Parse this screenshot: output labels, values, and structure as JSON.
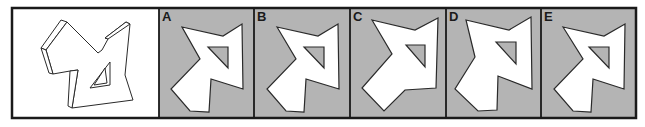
{
  "puzzle": {
    "frame": {
      "x": 12,
      "y": 8,
      "w": 624,
      "h": 110,
      "stroke": "#1a1a1a",
      "stroke_width": 2.5
    },
    "colors": {
      "question_bg": "#ffffff",
      "option_bg": "#b4b4b4",
      "shape_fill": "#ffffff",
      "shape_stroke": "#2a2a2a",
      "label_color": "#1a1a1a"
    },
    "question": {
      "x": 12,
      "y": 8,
      "w": 147,
      "h": 110,
      "faces": [
        "41,48 61,20 67,22 46,50",
        "46,50 67,22 98,53 102,50 108,39 105,38 126,22 130,24 125,75 133,100 72,108 78,70 70,71 53,74",
        "41,48 46,50 53,74 49,73",
        "105,38 108,39 130,24 126,22",
        "70,71 78,70 72,108 68,106",
        "110,62 90,88 110,85",
        "105,68 94,85 107,83"
      ]
    },
    "options": [
      {
        "label": "A",
        "x": 159,
        "w": 95,
        "outline": "182,27 223,36 242,24 243,89 211,79 209,112 190,111 171,89 200,59",
        "hole": "208,47 228,47 228,68"
      },
      {
        "label": "B",
        "x": 254,
        "w": 96,
        "outline": "277,27 318,36 338,24 339,89 306,79 304,112 286,111 267,89 296,59",
        "hole": "304,47 324,47 324,68"
      },
      {
        "label": "C",
        "x": 350,
        "w": 96,
        "outline": "372,20 415,30 438,18 436,88 405,90 384,111 362,88 392,54",
        "hole": "406,45 425,45 425,67"
      },
      {
        "label": "D",
        "x": 446,
        "w": 95,
        "outline": "466,20 509,30 531,17 532,89 498,76 497,110 478,111 455,89 475,57",
        "hole": "496,42 516,42 516,64"
      },
      {
        "label": "E",
        "x": 541,
        "w": 95,
        "outline": "563,27 604,36 625,24 624,89 593,79 591,112 573,111 554,89 583,59",
        "hole": "589,47 609,47 609,68"
      }
    ]
  }
}
